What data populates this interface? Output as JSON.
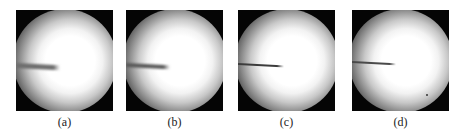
{
  "figure": {
    "panels": [
      {
        "label": "(a)",
        "probe": {
          "length": 44,
          "top": 53,
          "angle": 3,
          "thickness": 5,
          "color": "#6e6e6e",
          "blur": 1.2
        }
      },
      {
        "label": "(b)",
        "probe": {
          "length": 44,
          "top": 53,
          "angle": 3,
          "thickness": 4,
          "color": "#5a5a5a",
          "blur": 0.9
        }
      },
      {
        "label": "(c)",
        "probe": {
          "length": 46,
          "top": 53,
          "angle": 3,
          "thickness": 2,
          "color": "#3c3c3c",
          "blur": 0.3
        }
      },
      {
        "label": "(d)",
        "probe": {
          "length": 44,
          "top": 51,
          "angle": 3,
          "thickness": 2,
          "color": "#4a4a4a",
          "blur": 0.4
        }
      }
    ],
    "colors": {
      "background": "#ffffff",
      "panel": "#050505",
      "glow_center": "#ffffff"
    }
  }
}
